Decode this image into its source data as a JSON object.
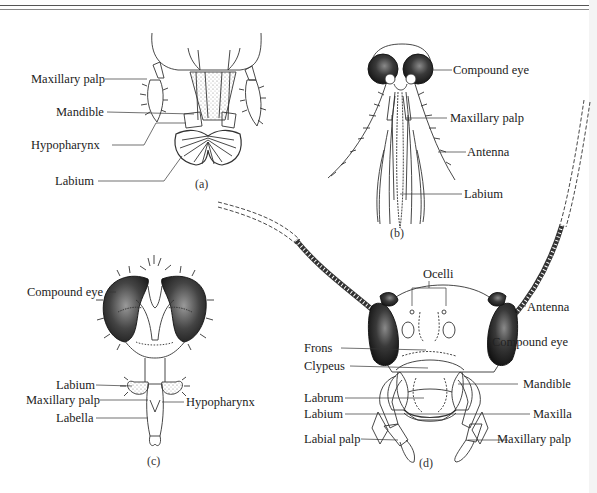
{
  "figure": {
    "panels": [
      {
        "id": "a",
        "caption": "(a)",
        "labels": [
          "Maxillary palp",
          "Mandible",
          "Hypopharynx",
          "Labium"
        ]
      },
      {
        "id": "b",
        "caption": "(b)",
        "labels": [
          "Compound eye",
          "Maxillary palp",
          "Antenna",
          "Labium"
        ]
      },
      {
        "id": "c",
        "caption": "(c)",
        "labels": [
          "Compound eye",
          "Labium",
          "Maxillary palp",
          "Labella",
          "Hypopharynx"
        ]
      },
      {
        "id": "d",
        "caption": "(d)",
        "labels": [
          "Ocelli",
          "Antenna",
          "Compound eye",
          "Frons",
          "Clypeus",
          "Mandible",
          "Labrum",
          "Labium",
          "Maxilla",
          "Labial palp",
          "Maxillary palp"
        ]
      }
    ]
  },
  "colors": {
    "ink": "#222222",
    "eye_fill": "#2a2a2a",
    "stipple": "#bdbdbd"
  }
}
